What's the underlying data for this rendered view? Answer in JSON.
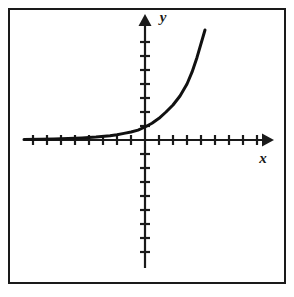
{
  "figure": {
    "kind": "coordinate-plane-graph",
    "background_color": "#ffffff",
    "ink_color": "#1a1a1a",
    "frame": {
      "present": true,
      "x": 8,
      "y": 8,
      "width": 277,
      "height": 275,
      "stroke_width": 2
    }
  },
  "axes": {
    "x_axis": {
      "label": "x",
      "orientation": "horizontal",
      "pixel_y": 140,
      "start_x": 24,
      "end_x": 268,
      "arrow": "right",
      "ticks_left_of_origin": 8,
      "ticks_right_of_origin": 8,
      "tick_spacing_px": 14,
      "tick_half_length_px": 5
    },
    "y_axis": {
      "label": "y",
      "orientation": "vertical",
      "pixel_x": 145,
      "start_y": 268,
      "end_y": 16,
      "arrow": "up",
      "ticks_above_origin": 6,
      "ticks_below_origin": 7,
      "tick_spacing_px": 14,
      "tick_half_length_px": 5
    },
    "origin": {
      "x": 145,
      "y": 140
    }
  },
  "chart_data": {
    "type": "line",
    "title": "",
    "subtitle": "",
    "xlabel": "x",
    "ylabel": "y",
    "function": "y = b^x  (b > 1, exponential growth)",
    "grid": false,
    "legend": false,
    "curve_stroke_width": 3,
    "curve_color": "#111111",
    "xlim": [
      -8.6,
      8.8
    ],
    "ylim": [
      -7.6,
      6.6
    ],
    "x_tick_values": [
      -8,
      -7,
      -6,
      -5,
      -4,
      -3,
      -2,
      -1,
      1,
      2,
      3,
      4,
      5,
      6,
      7,
      8
    ],
    "y_tick_values": [
      -7,
      -6,
      -5,
      -4,
      -3,
      -2,
      -1,
      1,
      2,
      3,
      4,
      5,
      6
    ],
    "tick_labels_shown": false,
    "series": [
      {
        "name": "exponential curve",
        "x": [
          -8.6,
          -7.5,
          -6.5,
          -5.5,
          -4.5,
          -3.5,
          -2.5,
          -2.0,
          -1.5,
          -1.0,
          -0.5,
          0.0,
          0.5,
          1.0,
          1.5,
          2.0,
          2.5,
          3.0,
          3.4,
          3.8,
          4.2
        ],
        "y": [
          0.03,
          0.05,
          0.07,
          0.1,
          0.15,
          0.21,
          0.31,
          0.38,
          0.47,
          0.57,
          0.71,
          0.93,
          1.2,
          1.55,
          2.0,
          2.5,
          3.15,
          4.0,
          4.85,
          5.9,
          7.4
        ],
        "pixel_points": [
          [
            24,
            139.6
          ],
          [
            40,
            139.3
          ],
          [
            54,
            139.0
          ],
          [
            68,
            138.6
          ],
          [
            82,
            138.0
          ],
          [
            96,
            137.1
          ],
          [
            110,
            135.7
          ],
          [
            117,
            134.7
          ],
          [
            124,
            133.4
          ],
          [
            131,
            132.0
          ],
          [
            138,
            130.1
          ],
          [
            145,
            127.0
          ],
          [
            152,
            123.2
          ],
          [
            159,
            118.3
          ],
          [
            166,
            112.0
          ],
          [
            173,
            105.0
          ],
          [
            180,
            96.0
          ],
          [
            187,
            84.0
          ],
          [
            192,
            72.2
          ],
          [
            197,
            57.4
          ],
          [
            205,
            30.0
          ]
        ],
        "endpoint_top": [
          205,
          30
        ],
        "endpoint_left": [
          24,
          140
        ],
        "asymptote": "y = 0 (x-axis)",
        "y_intercept": 1
      }
    ],
    "annotations": []
  }
}
